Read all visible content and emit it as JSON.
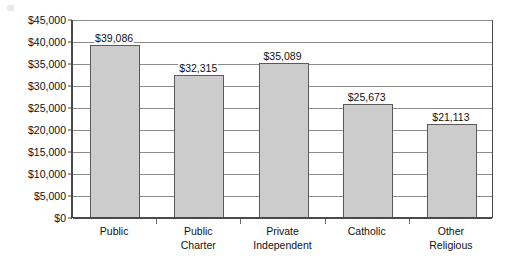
{
  "chart_data": {
    "type": "bar",
    "title": "",
    "subtitle": "",
    "xlabel": "",
    "ylabel": "",
    "categories": [
      "Public",
      "Public Charter",
      "Private Independent",
      "Catholic",
      "Other Religious"
    ],
    "category_lines": [
      [
        "Public",
        ""
      ],
      [
        "Public",
        "Charter"
      ],
      [
        "Private",
        "Independent"
      ],
      [
        "Catholic",
        ""
      ],
      [
        "Other",
        "Religious"
      ]
    ],
    "values": [
      39086,
      32315,
      35089,
      25673,
      21113
    ],
    "data_labels": [
      "$39,086",
      "$32,315",
      "$35,089",
      "$25,673",
      "$21,113"
    ],
    "ylim": [
      0,
      45000
    ],
    "ytick_step": 5000,
    "ytick_values": [
      0,
      5000,
      10000,
      15000,
      20000,
      25000,
      30000,
      35000,
      40000,
      45000
    ],
    "ytick_labels": [
      "$0",
      "$5,000",
      "$10,000",
      "$15,000",
      "$20,000",
      "$25,000",
      "$30,000",
      "$35,000",
      "$40,000",
      "$45,000"
    ],
    "grid": true,
    "grid_axis": "y",
    "legend": false,
    "legend_position": "none",
    "bar_color": "#cccccc",
    "bar_border_color": "#5a5a5a",
    "grid_color": "#8b8b8b",
    "axis_color": "#4a4a4a",
    "text_color": "#111111",
    "background_color": "#ffffff"
  }
}
